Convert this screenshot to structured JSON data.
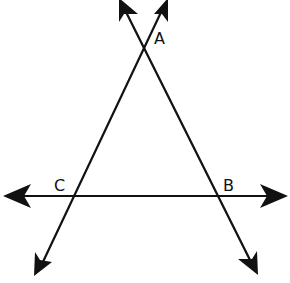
{
  "diagram": {
    "type": "geometry",
    "stroke_color": "#111111",
    "background": "#ffffff",
    "points": {
      "A": {
        "label": "A",
        "x": 144,
        "y": 35,
        "label_x": 155,
        "label_y": 44
      },
      "B": {
        "label": "B",
        "x": 219,
        "y": 196,
        "label_x": 223,
        "label_y": 190
      },
      "C": {
        "label": "C",
        "x": 72,
        "y": 196,
        "label_x": 55,
        "label_y": 190
      }
    },
    "lines": [
      {
        "name": "line-CB",
        "through": [
          "C",
          "B"
        ],
        "x1": 20,
        "y1": 196,
        "x2": 270,
        "y2": 196,
        "arrow_start": [
          3,
          196
        ],
        "arrow_end": [
          288,
          196
        ]
      },
      {
        "name": "line-AB",
        "through": [
          "A",
          "B"
        ],
        "x1": 128,
        "y1": 0,
        "x2": 255,
        "y2": 273,
        "arrow_start": [
          121,
          0
        ],
        "arrow_end": [
          258,
          274
        ]
      },
      {
        "name": "line-AC",
        "through": [
          "A",
          "C"
        ],
        "x1": 160,
        "y1": 0,
        "x2": 37,
        "y2": 275,
        "arrow_start": [
          167,
          0
        ],
        "arrow_end": [
          34,
          276
        ]
      }
    ]
  }
}
